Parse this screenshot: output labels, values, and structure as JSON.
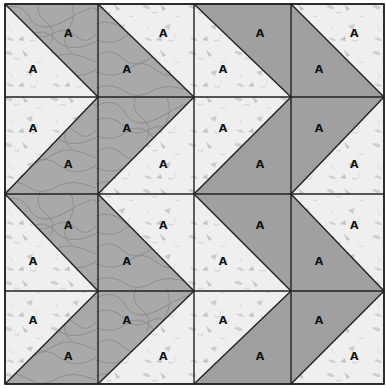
{
  "grid": {
    "rows": 4,
    "cols": 4,
    "x_lines": [
      5,
      98,
      194,
      291,
      384
    ],
    "y_lines": [
      4,
      97,
      194,
      291,
      384
    ]
  },
  "colors": {
    "light_fabric": "#efefef",
    "light_speckle": "#c9c9c9",
    "contour_fabric": "#a9a9a9",
    "contour_lines": "#888888",
    "solid_fabric": "#a0a0a0",
    "seam": "#222222"
  },
  "fabrics": {
    "left_chevron": "contour",
    "right_chevron": "solid"
  },
  "label_text": "A",
  "labels_per_cell": 2
}
